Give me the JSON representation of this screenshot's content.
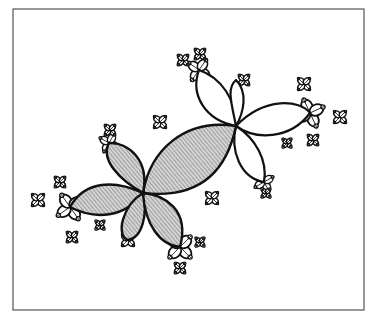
{
  "figure": {
    "type": "julia-set-illustration",
    "background": "#ffffff",
    "frame": {
      "x": 13,
      "y": 9,
      "width": 351,
      "height": 301,
      "stroke": "#555555"
    },
    "ink": "#111111",
    "hatch_color": "#666666",
    "hatch_fill": "#d4d4d4",
    "junctions": [
      {
        "name": "center",
        "x": 143,
        "y": 193
      },
      {
        "name": "upper-right",
        "x": 236,
        "y": 126
      },
      {
        "name": "far-right",
        "x": 310,
        "y": 113
      },
      {
        "name": "top",
        "x": 199,
        "y": 70
      },
      {
        "name": "left",
        "x": 70,
        "y": 207
      },
      {
        "name": "bottom",
        "x": 180,
        "y": 247
      },
      {
        "name": "right-bottom",
        "x": 264,
        "y": 182
      },
      {
        "name": "upper-left",
        "x": 109,
        "y": 143
      }
    ],
    "hatched_lobes": [
      {
        "name": "main-lobe",
        "d": "M143,193 C150,150 185,118 236,126 C228,165 205,200 143,193 Z"
      },
      {
        "name": "upper-left-lobe",
        "d": "M143,193 C120,180 100,160 109,143 C128,142 150,160 143,193 Z"
      },
      {
        "name": "left-lobe",
        "d": "M143,193 C115,180 85,180 70,207 C95,220 125,218 143,193 Z"
      },
      {
        "name": "lower-left-lobe",
        "d": "M143,193 C123,205 115,235 128,240 C142,238 148,215 143,193 Z"
      },
      {
        "name": "lower-right-lobe",
        "d": "M143,193 C165,195 190,210 180,247 C160,245 145,225 143,193 Z"
      }
    ],
    "white_lobes": [
      {
        "name": "up-lobe",
        "d": "M236,126 C205,120 190,95 199,70 C222,78 236,100 236,126 Z"
      },
      {
        "name": "up-right-lobe",
        "d": "M236,126 C232,105 226,88 236,80 C248,92 244,112 236,126 Z"
      },
      {
        "name": "right-lobe",
        "d": "M236,126 C265,96 300,100 310,113 C290,140 255,140 236,126 Z"
      },
      {
        "name": "down-lobe",
        "d": "M236,126 C230,150 240,178 264,182 C268,160 255,138 236,126 Z"
      }
    ],
    "petal_clusters": [
      {
        "name": "far-right-petals",
        "x": 310,
        "y": 113,
        "r": 13,
        "rot": 20
      },
      {
        "name": "top-petals",
        "x": 199,
        "y": 70,
        "r": 11,
        "rot": -10
      },
      {
        "name": "left-petals",
        "x": 70,
        "y": 207,
        "r": 13,
        "rot": 10
      },
      {
        "name": "bottom-petals",
        "x": 180,
        "y": 247,
        "r": 13,
        "rot": 0
      },
      {
        "name": "right-bottom-petals",
        "x": 264,
        "y": 182,
        "r": 9,
        "rot": 15
      },
      {
        "name": "upper-left-petals",
        "x": 109,
        "y": 143,
        "r": 9,
        "rot": -15
      },
      {
        "name": "left-top-petals",
        "x": 60,
        "y": 182,
        "r": 6,
        "rot": 0
      },
      {
        "name": "far-left-petals",
        "x": 38,
        "y": 200,
        "r": 7,
        "rot": 0
      },
      {
        "name": "left-bottom-petals",
        "x": 72,
        "y": 237,
        "r": 6,
        "rot": 0
      },
      {
        "name": "top-left-small-petals",
        "x": 183,
        "y": 60,
        "r": 6,
        "rot": 0
      },
      {
        "name": "top-top-petals",
        "x": 200,
        "y": 54,
        "r": 6,
        "rot": 0
      },
      {
        "name": "upper-mid-petals",
        "x": 244,
        "y": 80,
        "r": 6,
        "rot": 0
      },
      {
        "name": "right-top-petals",
        "x": 304,
        "y": 84,
        "r": 7,
        "rot": 0
      },
      {
        "name": "right-end-petals",
        "x": 340,
        "y": 117,
        "r": 7,
        "rot": 0
      },
      {
        "name": "right-lower-petals",
        "x": 313,
        "y": 140,
        "r": 6,
        "rot": 0
      },
      {
        "name": "mid-top-petals",
        "x": 160,
        "y": 122,
        "r": 7,
        "rot": 0
      },
      {
        "name": "center-bottom-petals",
        "x": 212,
        "y": 198,
        "r": 7,
        "rot": 0
      },
      {
        "name": "bottom-bottom-petals",
        "x": 180,
        "y": 268,
        "r": 6,
        "rot": 0
      },
      {
        "name": "bottom-right-petals",
        "x": 200,
        "y": 242,
        "r": 5,
        "rot": 0
      },
      {
        "name": "lower-left-petals",
        "x": 128,
        "y": 240,
        "r": 7,
        "rot": 0
      },
      {
        "name": "left-mid-small-petals",
        "x": 100,
        "y": 225,
        "r": 5,
        "rot": 0
      },
      {
        "name": "right-bottom-bottom-petals",
        "x": 266,
        "y": 193,
        "r": 5,
        "rot": 0
      },
      {
        "name": "right-mid-small-petals",
        "x": 287,
        "y": 143,
        "r": 5,
        "rot": 0
      },
      {
        "name": "upper-left-top-petals",
        "x": 110,
        "y": 130,
        "r": 6,
        "rot": 0
      }
    ]
  }
}
